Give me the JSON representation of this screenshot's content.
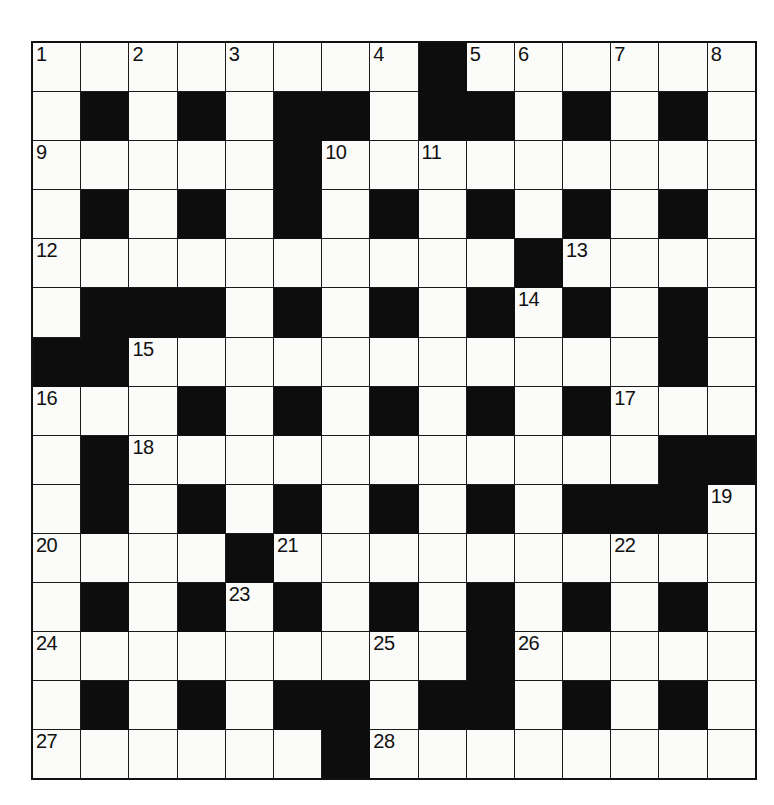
{
  "puzzle": {
    "title": "Crossword Grid",
    "rows": 15,
    "cols": 15,
    "cell_colors": {
      "white": "#fbfbfa",
      "block": "#0d0d0d",
      "grid_line": "#1b1b1b",
      "number_text": "#111111",
      "page_background": "#ffffff"
    },
    "numbers_present": [
      1,
      2,
      3,
      4,
      5,
      6,
      7,
      8,
      9,
      10,
      11,
      12,
      13,
      14,
      15,
      16,
      17,
      18,
      19,
      20,
      21,
      22,
      23,
      24,
      25,
      26,
      27,
      28
    ],
    "grid": [
      [
        "W1",
        "W",
        "W2",
        "W",
        "W3",
        "W",
        "W",
        "W4",
        "B",
        "W5",
        "W6",
        "W",
        "W7",
        "W",
        "W8"
      ],
      [
        "W",
        "B",
        "W",
        "B",
        "W",
        "B",
        "B",
        "W",
        "B",
        "B",
        "W",
        "B",
        "W",
        "B",
        "W"
      ],
      [
        "W9",
        "W",
        "W",
        "W",
        "W",
        "B",
        "W10",
        "W",
        "W11",
        "W",
        "W",
        "W",
        "W",
        "W",
        "W"
      ],
      [
        "W",
        "B",
        "W",
        "B",
        "W",
        "B",
        "W",
        "B",
        "W",
        "B",
        "W",
        "B",
        "W",
        "B",
        "W"
      ],
      [
        "W12",
        "W",
        "W",
        "W",
        "W",
        "W",
        "W",
        "W",
        "W",
        "W",
        "B",
        "W13",
        "W",
        "W",
        "W"
      ],
      [
        "W",
        "B",
        "B",
        "B",
        "W",
        "B",
        "W",
        "B",
        "W",
        "B",
        "W14",
        "B",
        "W",
        "B",
        "W"
      ],
      [
        "B",
        "B",
        "W15",
        "W",
        "W",
        "W",
        "W",
        "W",
        "W",
        "W",
        "W",
        "W",
        "W",
        "B",
        "W"
      ],
      [
        "W16",
        "W",
        "W",
        "B",
        "W",
        "B",
        "W",
        "B",
        "W",
        "B",
        "W",
        "B",
        "W17",
        "W",
        "W"
      ],
      [
        "W",
        "B",
        "W18",
        "W",
        "W",
        "W",
        "W",
        "W",
        "W",
        "W",
        "W",
        "W",
        "W",
        "B",
        "B"
      ],
      [
        "W",
        "B",
        "W",
        "B",
        "W",
        "B",
        "W",
        "B",
        "W",
        "B",
        "W",
        "B",
        "B",
        "B",
        "W19"
      ],
      [
        "W20",
        "W",
        "W",
        "W",
        "B",
        "W21",
        "W",
        "W",
        "W",
        "W",
        "W",
        "W",
        "W22",
        "W",
        "W"
      ],
      [
        "W",
        "B",
        "W",
        "B",
        "W23",
        "B",
        "W",
        "B",
        "W",
        "B",
        "W",
        "B",
        "W",
        "B",
        "W"
      ],
      [
        "W24",
        "W",
        "W",
        "W",
        "W",
        "W",
        "W",
        "W25",
        "W",
        "B",
        "W26",
        "W",
        "W",
        "W",
        "W"
      ],
      [
        "W",
        "B",
        "W",
        "B",
        "W",
        "B",
        "B",
        "W",
        "B",
        "B",
        "W",
        "B",
        "W",
        "B",
        "W"
      ],
      [
        "W27",
        "W",
        "W",
        "W",
        "W",
        "W",
        "B",
        "W28",
        "W",
        "W",
        "W",
        "W",
        "W",
        "W",
        "W"
      ]
    ]
  }
}
